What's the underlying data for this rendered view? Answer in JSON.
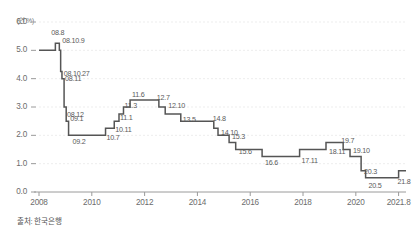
{
  "chart_data": {
    "type": "line",
    "title": "",
    "subtitle": "",
    "unit_label": "(연 %)",
    "xlabel": "",
    "ylabel": "",
    "ylim": [
      0.0,
      6.0
    ],
    "xlim": [
      2008.0,
      2021.9
    ],
    "grid": true,
    "legend": null,
    "line_style": "step-post",
    "source_note": "출처: 한국은행",
    "yticks": [
      "6.0",
      "5.0",
      "4.0",
      "3.0",
      "2.0",
      "1.0",
      "0.0"
    ],
    "ytick_values": [
      6.0,
      5.0,
      4.0,
      3.0,
      2.0,
      1.0,
      0.0
    ],
    "xticks": [
      "2008",
      "2010",
      "2012",
      "2014",
      "2016",
      "2018",
      "2020",
      "2021.8"
    ],
    "xtick_values": [
      2008,
      2010,
      2012,
      2014,
      2016,
      2018,
      2020,
      2021.62
    ],
    "series_name": "한국은행 기준금리",
    "x": [
      2008.0,
      2008.62,
      2008.77,
      2008.82,
      2008.87,
      2008.95,
      2009.03,
      2009.12,
      2010.52,
      2010.85,
      2011.03,
      2011.2,
      2011.45,
      2012.54,
      2012.78,
      2013.37,
      2014.62,
      2014.78,
      2015.2,
      2015.45,
      2016.45,
      2017.87,
      2018.87,
      2019.52,
      2019.78,
      2020.2,
      2020.37,
      2021.62
    ],
    "values": [
      5.0,
      5.25,
      5.0,
      4.25,
      4.0,
      3.0,
      2.5,
      2.0,
      2.25,
      2.5,
      2.75,
      3.0,
      3.25,
      3.0,
      2.75,
      2.5,
      2.25,
      2.0,
      1.75,
      1.5,
      1.25,
      1.5,
      1.75,
      1.5,
      1.25,
      0.75,
      0.5,
      0.75
    ],
    "point_labels": [
      {
        "label": "08.8",
        "value": 5.25,
        "x": 2008.62
      },
      {
        "label": "08.10.9",
        "value": 5.0,
        "x": 2008.77
      },
      {
        "label": "08.10.27",
        "value": 4.25,
        "x": 2008.82
      },
      {
        "label": "08.11",
        "value": 4.0,
        "x": 2008.87
      },
      {
        "label": "08.12",
        "value": 3.0,
        "x": 2008.95
      },
      {
        "label": "09.1",
        "value": 2.5,
        "x": 2009.03
      },
      {
        "label": "09.2",
        "value": 2.0,
        "x": 2009.12
      },
      {
        "label": "10.7",
        "value": 2.25,
        "x": 2010.52
      },
      {
        "label": "10.11",
        "value": 2.5,
        "x": 2010.85
      },
      {
        "label": "11.1",
        "value": 2.75,
        "x": 2011.03
      },
      {
        "label": "11.3",
        "value": 3.0,
        "x": 2011.2
      },
      {
        "label": "11.6",
        "value": 3.25,
        "x": 2011.45
      },
      {
        "label": "12.7",
        "value": 3.0,
        "x": 2012.54
      },
      {
        "label": "12.10",
        "value": 2.75,
        "x": 2012.78
      },
      {
        "label": "13.5",
        "value": 2.5,
        "x": 2013.37
      },
      {
        "label": "14.8",
        "value": 2.25,
        "x": 2014.62
      },
      {
        "label": "14.10",
        "value": 2.0,
        "x": 2014.78
      },
      {
        "label": "15.3",
        "value": 1.75,
        "x": 2015.2
      },
      {
        "label": "15.6",
        "value": 1.5,
        "x": 2015.45
      },
      {
        "label": "16.6",
        "value": 1.25,
        "x": 2016.45
      },
      {
        "label": "17.11",
        "value": 1.5,
        "x": 2017.87
      },
      {
        "label": "18.11",
        "value": 1.75,
        "x": 2018.87
      },
      {
        "label": "19.7",
        "value": 1.5,
        "x": 2019.52
      },
      {
        "label": "19.10",
        "value": 1.25,
        "x": 2019.78
      },
      {
        "label": "20.3",
        "value": 0.75,
        "x": 2020.2
      },
      {
        "label": "20.5",
        "value": 0.5,
        "x": 2020.37
      },
      {
        "label": "21.8",
        "value": 0.75,
        "x": 2021.62
      }
    ],
    "colors": {
      "line": "#555555",
      "grid": "#e8e8e8",
      "axis": "#999999",
      "tick_text": "#6c6c6c",
      "label_text": "#5a5a5a"
    }
  },
  "label_offsets": [
    {
      "dx": -4,
      "dy": -11,
      "anchor": "start"
    },
    {
      "dx": 3,
      "dy": -10,
      "anchor": "start"
    },
    {
      "dx": 3,
      "dy": 1,
      "anchor": "start"
    },
    {
      "dx": 3,
      "dy": -1,
      "anchor": "start"
    },
    {
      "dx": 3,
      "dy": 7,
      "anchor": "start"
    },
    {
      "dx": 4,
      "dy": -3,
      "anchor": "start"
    },
    {
      "dx": 4,
      "dy": 6,
      "anchor": "start"
    },
    {
      "dx": 1,
      "dy": 9,
      "anchor": "start"
    },
    {
      "dx": 1,
      "dy": 8,
      "anchor": "start"
    },
    {
      "dx": 1,
      "dy": 3,
      "anchor": "start"
    },
    {
      "dx": 1,
      "dy": -2,
      "anchor": "start"
    },
    {
      "dx": 2,
      "dy": -6,
      "anchor": "start"
    },
    {
      "dx": -2,
      "dy": -10,
      "anchor": "start"
    },
    {
      "dx": 3,
      "dy": -9,
      "anchor": "start"
    },
    {
      "dx": 2,
      "dy": -2,
      "anchor": "start"
    },
    {
      "dx": -1,
      "dy": -10,
      "anchor": "start"
    },
    {
      "dx": 3,
      "dy": -3,
      "anchor": "start"
    },
    {
      "dx": 3,
      "dy": -6,
      "anchor": "start"
    },
    {
      "dx": 3,
      "dy": 1,
      "anchor": "start"
    },
    {
      "dx": 3,
      "dy": 5,
      "anchor": "start"
    },
    {
      "dx": 2,
      "dy": 10,
      "anchor": "start"
    },
    {
      "dx": 3,
      "dy": 9,
      "anchor": "start"
    },
    {
      "dx": -2,
      "dy": -10,
      "anchor": "start"
    },
    {
      "dx": 3,
      "dy": -7,
      "anchor": "start"
    },
    {
      "dx": 3,
      "dy": 0,
      "anchor": "start"
    },
    {
      "dx": 3,
      "dy": 7,
      "anchor": "start"
    },
    {
      "dx": -1,
      "dy": 10,
      "anchor": "start"
    }
  ]
}
